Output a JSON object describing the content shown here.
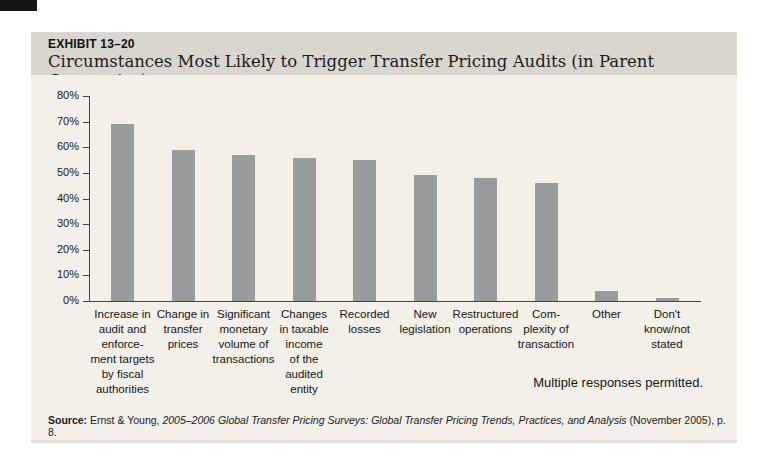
{
  "exhibit": {
    "label": "EXHIBIT 13–20",
    "title": "Circumstances Most Likely to Trigger Transfer Pricing Audits (in Parent Companies)"
  },
  "chart_data": {
    "type": "bar",
    "title": "Circumstances Most Likely to Trigger Transfer Pricing Audits (in Parent Companies)",
    "categories": [
      "Increase in audit and enforcement targets by fiscal authorities",
      "Change in transfer prices",
      "Significant monetary volume of transactions",
      "Changes in taxable income of the audited entity",
      "Recorded losses",
      "New legislation",
      "Restructured operations",
      "Complexity of transaction",
      "Other",
      "Don't know/not stated"
    ],
    "category_label_lines": [
      "Increase in\naudit and\nenforce-\nment targets\nby fiscal\nauthorities",
      "Change in\ntransfer\nprices",
      "Significant\nmonetary\nvolume of\ntransactions",
      "Changes\nin taxable\nincome\nof the\naudited\nentity",
      "Recorded\nlosses",
      "New\nlegislation",
      "Restructured\noperations",
      "Com-\nplexity of\ntransaction",
      "Other",
      "Don't\nknow/not\nstated"
    ],
    "values": [
      69,
      59,
      57,
      56,
      55,
      49,
      48,
      46,
      4,
      1
    ],
    "unit": "%",
    "xlabel": "",
    "ylabel": "",
    "ylim": [
      0,
      80
    ],
    "ytick_step": 10,
    "ytick_labels": [
      "0%",
      "10%",
      "20%",
      "30%",
      "40%",
      "50%",
      "60%",
      "70%",
      "80%"
    ],
    "grid": false,
    "legend": null,
    "bar_color": "#9b9b9b",
    "note": "Multiple responses permitted."
  },
  "source": {
    "prefix": "Source:",
    "text1": " Ernst & Young, ",
    "italic": "2005–2006 Global Transfer Pricing Surveys: Global Transfer Pricing Trends, Practices, and Analysis",
    "text2": " (November 2005), p. 8."
  },
  "colors": {
    "panel_header_bg": "#d9d6ce",
    "panel_body_bg": "#f2f0e9",
    "bar": "#9b9b9b",
    "axis": "#444444",
    "page_tab": "#161616"
  }
}
